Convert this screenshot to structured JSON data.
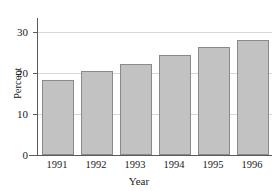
{
  "chart_data": {
    "type": "bar",
    "title": "",
    "subtitle": "",
    "xlabel": "Year",
    "ylabel": "Percent",
    "categories": [
      "1991",
      "1992",
      "1993",
      "1994",
      "1995",
      "1996"
    ],
    "values": [
      17.7,
      19.8,
      21.5,
      23.6,
      25.6,
      27.3
    ],
    "series": [
      {
        "name": "Percent",
        "values": [
          17.7,
          19.8,
          21.5,
          23.6,
          25.6,
          27.3
        ]
      }
    ],
    "ylim": [
      0,
      32
    ],
    "xlim": [
      0,
      6
    ],
    "y_ticks": [
      0,
      10,
      20,
      30
    ],
    "y_tick_labels": [
      "0",
      "10",
      "20",
      "30"
    ],
    "x_tick_labels": [
      "1991",
      "1992",
      "1993",
      "1994",
      "1995",
      "1996"
    ],
    "grid": true,
    "grid_axis": "y",
    "legend": false,
    "legend_position": "none",
    "annotations": [],
    "bar_fill_color": "#c2c2c2",
    "bar_edge_color": "#8a8a8a",
    "gridline_color": "#d8d8d8",
    "axis_color": "#5a5a5a",
    "background_color": "#ffffff",
    "text_color": "#1a1a1a"
  }
}
